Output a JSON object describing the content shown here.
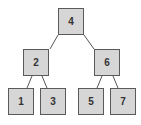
{
  "diagram": {
    "type": "binary-search-tree",
    "nodes": [
      {
        "id": "n4",
        "label": "4",
        "x": 58,
        "y": 8
      },
      {
        "id": "n2",
        "label": "2",
        "x": 23,
        "y": 49
      },
      {
        "id": "n6",
        "label": "6",
        "x": 94,
        "y": 49
      },
      {
        "id": "n1",
        "label": "1",
        "x": 8,
        "y": 88
      },
      {
        "id": "n3",
        "label": "3",
        "x": 40,
        "y": 88
      },
      {
        "id": "n5",
        "label": "5",
        "x": 78,
        "y": 88
      },
      {
        "id": "n7",
        "label": "7",
        "x": 110,
        "y": 88
      }
    ],
    "edges": [
      {
        "from": "4",
        "to": "2"
      },
      {
        "from": "4",
        "to": "6"
      },
      {
        "from": "2",
        "to": "1"
      },
      {
        "from": "2",
        "to": "3"
      },
      {
        "from": "6",
        "to": "5"
      },
      {
        "from": "6",
        "to": "7"
      }
    ],
    "colors": {
      "node_fill": "#d6d6d6",
      "node_border": "#5a5a5a",
      "edge": "#555555"
    }
  }
}
